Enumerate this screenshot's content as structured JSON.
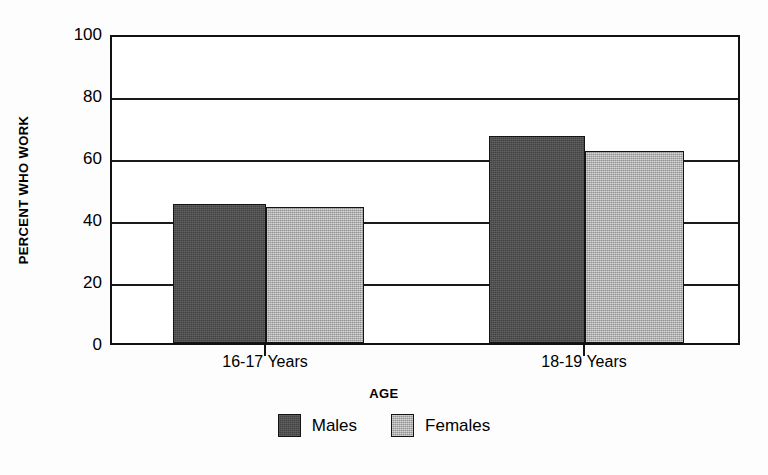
{
  "chart_data": {
    "type": "bar",
    "title": "",
    "xlabel": "AGE",
    "ylabel": "PERCENT WHO WORK",
    "categories": [
      "16-17 Years",
      "18-19 Years"
    ],
    "series": [
      {
        "name": "Males",
        "values": [
          45.5,
          68
        ],
        "color": "#4c4c4c"
      },
      {
        "name": "Females",
        "values": [
          44.5,
          63
        ],
        "color": "#b3b3b3"
      }
    ],
    "ylim": [
      0,
      100
    ],
    "ytick_values": [
      100,
      80,
      60,
      40,
      20,
      0
    ],
    "ytick_labels": [
      "100",
      "80",
      "60",
      "40",
      "20",
      "0"
    ],
    "grid": true,
    "grid_axis": "y",
    "legend_position": "bottom-center",
    "bar_grouping": "adjacent-touching"
  },
  "legend": {
    "items": [
      {
        "label": "Males",
        "swatch": "males-swatch"
      },
      {
        "label": "Females",
        "swatch": "females-swatch"
      }
    ]
  }
}
